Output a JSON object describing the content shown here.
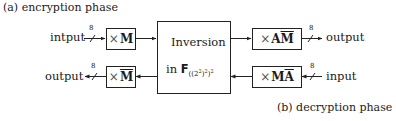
{
  "captions": {
    "encryption": "(a) encryption phase",
    "decryption": "(b) decryption phase"
  },
  "encryption_path": {
    "input_label": "intput",
    "bus_width": "8",
    "box1": {
      "op": "×",
      "matrix": "M",
      "bar": false
    },
    "box2": {
      "op": "×",
      "matrix_prefix": "A",
      "matrix": "M",
      "bar_on": "M"
    },
    "output_label": "output",
    "output_bus_width": "8"
  },
  "decryption_path": {
    "input_label": "input",
    "bus_width": "8",
    "box1": {
      "op": "×",
      "matrix_prefix": "M",
      "matrix": "A",
      "bar_on": "A"
    },
    "box2": {
      "op": "×",
      "matrix": "M",
      "bar_on": "M"
    },
    "output_label": "output",
    "output_bus_width": "8"
  },
  "inversion_block": {
    "line1": "Inversion",
    "line2_prefix": "in ",
    "field_symbol": "F",
    "field_subscript": "((2",
    "sub_sup1": "2",
    "sub_mid": ")",
    "sub_sup2": "2",
    "sub_end": ")",
    "sub_sup3": "2"
  }
}
